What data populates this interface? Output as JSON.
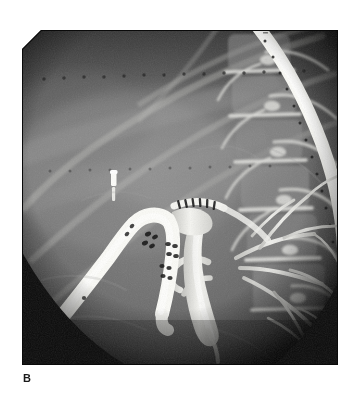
{
  "figure": {
    "panel_label": "B",
    "modality": "radiograph",
    "study": "endoscopic-retrograde-cholangiopancreatogram",
    "background_color": "#ffffff",
    "film_border_color": "#0d0d0d"
  },
  "radiograph": {
    "frame": {
      "x": 22,
      "y": 30,
      "width": 316,
      "height": 335,
      "corner_chamfer_px": 19,
      "chamfer_corner": "top-left"
    },
    "tone": {
      "film_base": "#4a4a4a",
      "soft_tissue_mid": "#6f6f6f",
      "soft_tissue_light": "#8d8d8d",
      "lung_field_dark": "#3a3a3a",
      "collimation_shadow": "#111111",
      "contrast_white": "#f2f2f0",
      "instrument_white": "#fbfbf8",
      "marker_black": "#141414"
    },
    "features": [
      {
        "name": "collimation-vignette",
        "description": "Dark circular collimation shadow cropping the lower-left and lower-right corners of the exposed field",
        "center_x": 148,
        "center_y": 130,
        "radius": 228
      },
      {
        "name": "lumbar-spine",
        "description": "Lumbar vertebral bodies and transverse processes projected along the right side of the film",
        "x_range": [
          195,
          300
        ],
        "y_range": [
          10,
          320
        ]
      },
      {
        "name": "rib-shadows",
        "description": "Oblique lower rib arcs crossing the upper half of the field",
        "count": 4
      },
      {
        "name": "grid-marker-dots",
        "description": "Two horizontal rows of small black registration dots across the upper film",
        "rows": 2,
        "row_y": [
          47,
          137
        ],
        "dot_count_per_row": 16
      },
      {
        "name": "radiopaque-marker-band",
        "description": "Curved white radiopaque marker band with regularly spaced dark graduation dots running from the top edge down the right side",
        "graduation_count": 18
      },
      {
        "name": "duodenoscope",
        "description": "Side-viewing endoscope shaft forming a sharp U-turn in the mid-left field, with dark band markings along the insertion tube and at the bending section",
        "band_marking_groups": 5
      },
      {
        "name": "surgical-clip",
        "description": "Small bright vertical metallic surgical clip above the endoscope bending section",
        "x": 113,
        "y": 172
      },
      {
        "name": "cannula-and-sphincterotome",
        "description": "Catheter with dark ring markers entering the papilla adjacent to the scope tip",
        "ring_marker_count": 6
      },
      {
        "name": "opacified-bile-ducts",
        "description": "Contrast-filled common bile duct, cystic duct stump and intrahepatic radicles forming a branching white tree in the right mid-field",
        "branches": 5
      },
      {
        "name": "contrast-filled-common-duct",
        "description": "Broad vertical column of dense contrast medium in the common bile duct"
      }
    ]
  }
}
